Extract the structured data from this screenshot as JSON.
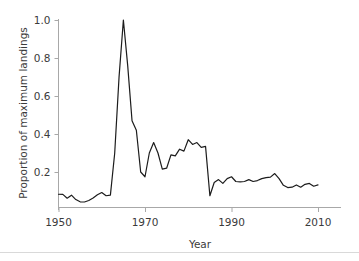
{
  "figure": {
    "background_color": "#ffffff",
    "line_color": "#1c1c1c",
    "axis_color": "#a8a8a8",
    "text_color": "#3b3b3b"
  },
  "chart_data": {
    "type": "line",
    "title": "",
    "xlabel": "Year",
    "ylabel": "Proportion of maximum landings",
    "xlim": [
      1948,
      2012
    ],
    "ylim": [
      0.0,
      1.02
    ],
    "grid": false,
    "legend": false,
    "xticks": [
      1950,
      1970,
      1990,
      2010
    ],
    "xtick_labels": [
      "1950",
      "1970",
      "1990",
      "2010"
    ],
    "yticks": [
      0.2,
      0.4,
      0.6,
      0.8,
      1.0
    ],
    "ytick_labels": [
      "0.2",
      "0.4",
      "0.6",
      "0.8",
      "1.0"
    ],
    "series": [
      {
        "name": "Proportion of maximum landings",
        "x": [
          1950,
          1951,
          1952,
          1953,
          1954,
          1955,
          1956,
          1957,
          1958,
          1959,
          1960,
          1961,
          1962,
          1963,
          1964,
          1965,
          1966,
          1967,
          1968,
          1969,
          1970,
          1971,
          1972,
          1973,
          1974,
          1975,
          1976,
          1977,
          1978,
          1979,
          1980,
          1981,
          1982,
          1983,
          1984,
          1985,
          1986,
          1987,
          1988,
          1989,
          1990,
          1991,
          1992,
          1993,
          1994,
          1995,
          1996,
          1997,
          1998,
          1999,
          2000,
          2001,
          2002,
          2003,
          2004,
          2005,
          2006,
          2007,
          2008,
          2009,
          2010
        ],
        "y": [
          0.083,
          0.082,
          0.062,
          0.078,
          0.055,
          0.043,
          0.042,
          0.05,
          0.063,
          0.08,
          0.092,
          0.075,
          0.078,
          0.3,
          0.7,
          1.0,
          0.76,
          0.47,
          0.42,
          0.2,
          0.175,
          0.3,
          0.355,
          0.3,
          0.215,
          0.22,
          0.29,
          0.285,
          0.32,
          0.31,
          0.37,
          0.345,
          0.355,
          0.33,
          0.335,
          0.075,
          0.145,
          0.16,
          0.14,
          0.165,
          0.175,
          0.15,
          0.148,
          0.15,
          0.16,
          0.15,
          0.155,
          0.165,
          0.17,
          0.173,
          0.192,
          0.165,
          0.13,
          0.118,
          0.12,
          0.132,
          0.12,
          0.135,
          0.14,
          0.125,
          0.132
        ]
      }
    ]
  }
}
